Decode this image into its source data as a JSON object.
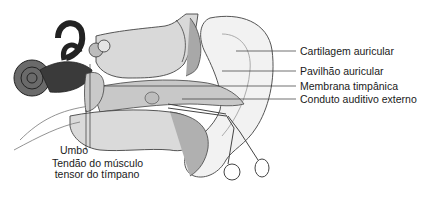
{
  "diagram": {
    "labels": {
      "cartilagem": "Cartilagem auricular",
      "pavilhao": "Pavilhão auricular",
      "membrana": "Membrana timpânica",
      "conduto": "Conduto auditivo externo",
      "umbo": "Umbo",
      "tendao_1": "Tendão do músculo",
      "tendao_2": "tensor do tímpano"
    },
    "colors": {
      "line": "#333333",
      "bone": "#d8d8d8",
      "tissue": "#9a9a9a",
      "dark": "#2a2a2a",
      "skin": "#ededed"
    }
  }
}
